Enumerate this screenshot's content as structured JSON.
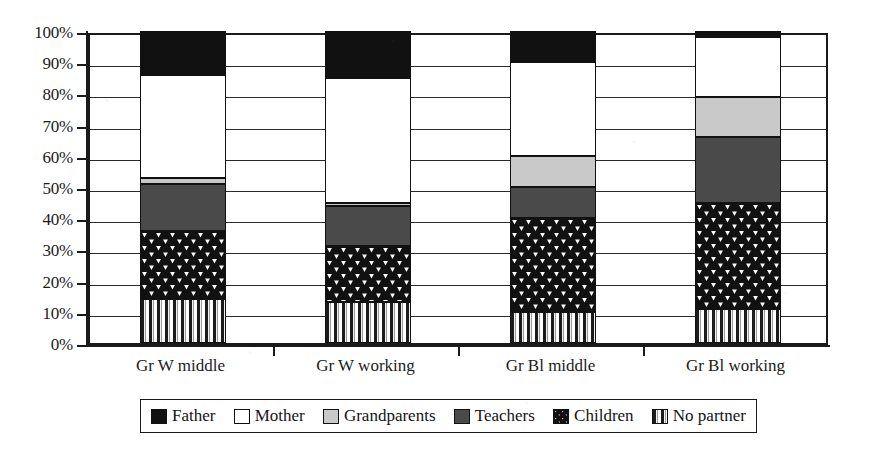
{
  "chart_data": {
    "type": "bar",
    "stacked": true,
    "normalized": "100%",
    "title": "",
    "xlabel": "",
    "ylabel": "",
    "ylim": [
      0,
      100
    ],
    "grid": true,
    "legend_position": "bottom",
    "categories": [
      "Gr W middle",
      "Gr W working",
      "Gr Bl middle",
      "Gr Bl working"
    ],
    "ytick_labels": [
      "0%",
      "10%",
      "20%",
      "30%",
      "40%",
      "50%",
      "60%",
      "70%",
      "80%",
      "90%",
      "100%"
    ],
    "ytick_values": [
      0,
      10,
      20,
      30,
      40,
      50,
      60,
      70,
      80,
      90,
      100
    ],
    "series": [
      {
        "name": "No partner",
        "fill": "vertical-stripes",
        "color": "#ffffff",
        "values": [
          14,
          13,
          10,
          11
        ]
      },
      {
        "name": "Children",
        "fill": "triangle-pattern",
        "color": "#111111",
        "values": [
          22,
          18,
          30,
          34
        ]
      },
      {
        "name": "Teachers",
        "fill": "solid-dark-gray",
        "color": "#4a4a4a",
        "values": [
          15,
          13,
          10,
          21
        ]
      },
      {
        "name": "Grandparents",
        "fill": "solid-light-gray",
        "color": "#c9c9c9",
        "values": [
          2,
          1,
          10,
          13
        ]
      },
      {
        "name": "Mother",
        "fill": "solid-white",
        "color": "#ffffff",
        "values": [
          33,
          40,
          30,
          19
        ]
      },
      {
        "name": "Father",
        "fill": "solid-black",
        "color": "#111111",
        "values": [
          14,
          15,
          10,
          2
        ]
      }
    ],
    "cumulative_tops": {
      "Gr W middle": {
        "No partner": 14,
        "Children": 36,
        "Teachers": 51,
        "Grandparents": 53,
        "Mother": 86,
        "Father": 100
      },
      "Gr W working": {
        "No partner": 13,
        "Children": 31,
        "Teachers": 44,
        "Grandparents": 45,
        "Mother": 85,
        "Father": 100
      },
      "Gr Bl middle": {
        "No partner": 10,
        "Children": 40,
        "Teachers": 50,
        "Grandparents": 60,
        "Mother": 90,
        "Father": 100
      },
      "Gr Bl working": {
        "No partner": 11,
        "Children": 45,
        "Teachers": 66,
        "Grandparents": 79,
        "Mother": 98,
        "Father": 100
      }
    }
  },
  "legend": {
    "items": [
      {
        "label": "Father",
        "swatch": "solid-black-swatch"
      },
      {
        "label": "Mother",
        "swatch": "solid-white-swatch"
      },
      {
        "label": "Grandparents",
        "swatch": "solid-light-gray-swatch"
      },
      {
        "label": "Teachers",
        "swatch": "solid-dark-gray-swatch"
      },
      {
        "label": "Children",
        "swatch": "triangle-pattern-swatch"
      },
      {
        "label": "No partner",
        "swatch": "vertical-stripes-swatch"
      }
    ]
  }
}
